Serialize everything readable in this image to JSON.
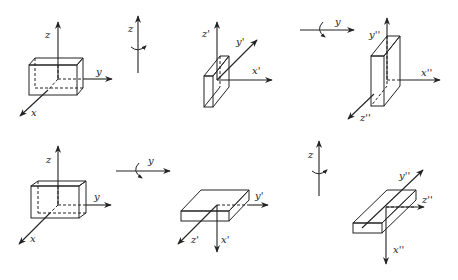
{
  "diagram": {
    "rows": [
      {
        "name": "top-row",
        "steps": [
          {
            "type": "frame",
            "labels": {
              "z": "z",
              "y": "y",
              "x": "x"
            }
          },
          {
            "type": "rotation",
            "axis_label": "z",
            "direction": "vertical"
          },
          {
            "type": "frame",
            "labels": {
              "z": "z'",
              "y": "y'",
              "x": "x'"
            }
          },
          {
            "type": "rotation",
            "axis_label": "y",
            "direction": "horizontal"
          },
          {
            "type": "frame",
            "labels": {
              "y": "y''",
              "x": "x''",
              "z": "z''"
            }
          }
        ]
      },
      {
        "name": "bottom-row",
        "steps": [
          {
            "type": "frame",
            "labels": {
              "z": "z",
              "y": "y",
              "x": "x"
            }
          },
          {
            "type": "rotation",
            "axis_label": "y",
            "direction": "horizontal"
          },
          {
            "type": "frame",
            "labels": {
              "y": "y'",
              "z": "z'",
              "x": "x'"
            }
          },
          {
            "type": "rotation",
            "axis_label": "z",
            "direction": "vertical"
          },
          {
            "type": "frame",
            "labels": {
              "y": "y''",
              "z": "z''",
              "x": "x''"
            }
          }
        ]
      }
    ]
  }
}
